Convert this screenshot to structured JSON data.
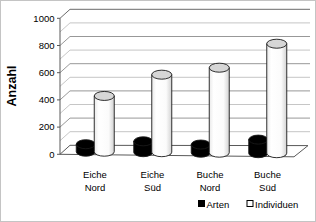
{
  "chart_data": {
    "type": "bar",
    "style": "3d-cylinder",
    "ylabel": "Anzahl",
    "ylim": [
      0,
      1000
    ],
    "ytick_step": 200,
    "minor_gridline_step": 100,
    "yticks": [
      "0",
      "200",
      "400",
      "600",
      "800",
      "1000"
    ],
    "categories": [
      {
        "label": "Eiche Nord",
        "line1": "Eiche",
        "line2": "Nord"
      },
      {
        "label": "Eiche Süd",
        "line1": "Eiche",
        "line2": "Süd"
      },
      {
        "label": "Buche Nord",
        "line1": "Buche",
        "line2": "Nord"
      },
      {
        "label": "Buche Süd",
        "line1": "Buche",
        "line2": "Süd"
      }
    ],
    "series": [
      {
        "name": "Arten",
        "color": "#000000",
        "values": [
          55,
          80,
          60,
          100
        ]
      },
      {
        "name": "Individuen",
        "color": "#ffffff",
        "values": [
          410,
          570,
          625,
          805
        ]
      }
    ],
    "legend_position": "bottom-right",
    "grid": "on"
  },
  "colors": {
    "background": "#ffffff",
    "border": "#c4c4c4",
    "frame": "#595959",
    "major_grid": "#8c8c8c",
    "minor_grid": "#c0c0c0",
    "bar_outline": "#1a1a1a",
    "cylinder_top": "#d6d6d6",
    "text": "#000000"
  }
}
